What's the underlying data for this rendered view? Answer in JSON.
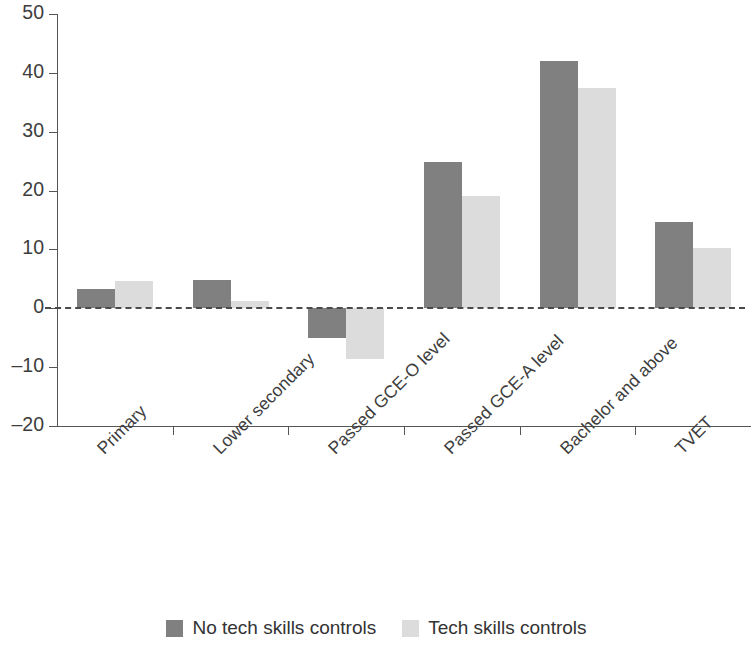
{
  "chart_data": {
    "type": "bar",
    "title": "",
    "subtitle": "",
    "xlabel": "",
    "ylabel": "",
    "ylim": [
      -20,
      50
    ],
    "yticks": [
      50,
      40,
      30,
      20,
      10,
      0,
      -10,
      -20
    ],
    "ytick_labels": [
      "50",
      "40",
      "30",
      "20",
      "10",
      "0",
      "–10",
      "–20"
    ],
    "grid": false,
    "zero_line": true,
    "zero_line_style": "dashed",
    "legend_position": "bottom",
    "categories": [
      "Primary",
      "Lower secondary",
      "Passed GCE-O level",
      "Passed GCE-A level",
      "Bachelor and above",
      "TVET"
    ],
    "series": [
      {
        "name": "No tech skills controls",
        "color": "#808080",
        "values": [
          3.3,
          4.8,
          -5.0,
          24.8,
          42.0,
          14.6
        ]
      },
      {
        "name": "Tech skills controls",
        "color": "#dcdcdc",
        "values": [
          4.6,
          1.3,
          -8.6,
          19.0,
          37.5,
          10.2
        ]
      }
    ]
  },
  "legend": {
    "items": [
      {
        "label": "No tech skills controls",
        "swatch": "dark"
      },
      {
        "label": "Tech skills controls",
        "swatch": "light"
      }
    ]
  },
  "colors": {
    "series_dark": "#808080",
    "series_light": "#dcdcdc",
    "axis": "#555555",
    "text": "#3d3d3d"
  }
}
